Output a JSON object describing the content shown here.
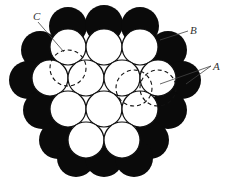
{
  "diagram": {
    "colors": {
      "outer": "#0a0a0a",
      "inner": "#ffffff",
      "stroke": "#111111",
      "background": "#ffffff"
    },
    "radius": 18,
    "black_circles": [
      {
        "x": 68,
        "y": 26
      },
      {
        "x": 104,
        "y": 24
      },
      {
        "x": 140,
        "y": 26
      },
      {
        "x": 40,
        "y": 50
      },
      {
        "x": 168,
        "y": 50
      },
      {
        "x": 28,
        "y": 80
      },
      {
        "x": 182,
        "y": 80
      },
      {
        "x": 42,
        "y": 110
      },
      {
        "x": 168,
        "y": 110
      },
      {
        "x": 58,
        "y": 140
      },
      {
        "x": 150,
        "y": 140
      },
      {
        "x": 76,
        "y": 158
      },
      {
        "x": 104,
        "y": 158
      },
      {
        "x": 134,
        "y": 158
      }
    ],
    "white_circles": [
      {
        "x": 68,
        "y": 47
      },
      {
        "x": 104,
        "y": 47
      },
      {
        "x": 140,
        "y": 47
      },
      {
        "x": 50,
        "y": 78
      },
      {
        "x": 86,
        "y": 78
      },
      {
        "x": 122,
        "y": 78
      },
      {
        "x": 158,
        "y": 78
      },
      {
        "x": 68,
        "y": 109
      },
      {
        "x": 104,
        "y": 109
      },
      {
        "x": 140,
        "y": 109
      },
      {
        "x": 86,
        "y": 140
      },
      {
        "x": 122,
        "y": 140
      }
    ],
    "dashed_circles": [
      {
        "x": 68,
        "y": 68
      },
      {
        "x": 134,
        "y": 88
      },
      {
        "x": 158,
        "y": 88
      }
    ],
    "labels": [
      {
        "text": "C",
        "x": 33,
        "y": 20,
        "line": [
          [
            38,
            22
          ],
          [
            64,
            52
          ]
        ]
      },
      {
        "text": "B",
        "x": 190,
        "y": 34,
        "line": [
          [
            188,
            31
          ],
          [
            160,
            40
          ]
        ]
      },
      {
        "text": "A",
        "x": 213,
        "y": 70,
        "line": [
          [
            211,
            66
          ],
          [
            160,
            84
          ]
        ],
        "line2": [
          [
            211,
            66
          ],
          [
            186,
            84
          ]
        ]
      }
    ]
  }
}
